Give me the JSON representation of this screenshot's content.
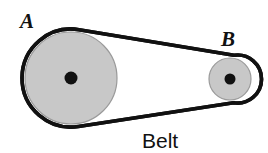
{
  "figure": {
    "type": "mechanical-diagram",
    "background_color": "#ffffff"
  },
  "labels": {
    "pulley_a": "A",
    "pulley_b": "B",
    "belt": "Belt"
  },
  "colors": {
    "pulley_fill": "#c8c8c8",
    "pulley_edge": "#9a9a9a",
    "belt_stroke": "#111111",
    "hub_dot": "#111111",
    "text": "#111111",
    "background": "#ffffff"
  },
  "geometry": {
    "pulley_a": {
      "cx": 71,
      "cy": 78,
      "r": 46,
      "hub_r": 6.5
    },
    "pulley_b": {
      "cx": 230,
      "cy": 79,
      "r": 21,
      "hub_r": 5.5
    },
    "belt": {
      "stroke_width": 3.6,
      "offset_from_pulley": 3,
      "top_tangent": {
        "x1": 71,
        "y1": 29,
        "x2": 230,
        "y2": 55
      },
      "bottom_tangent": {
        "x1": 71,
        "y1": 127,
        "x2": 230,
        "y2": 103
      }
    },
    "label_positions": {
      "pulley_a": {
        "x": 20,
        "y": 28
      },
      "pulley_b": {
        "x": 221,
        "y": 46
      },
      "belt": {
        "x": 142,
        "y": 148
      }
    },
    "label_font_sizes": {
      "pulley_a": 21,
      "pulley_b": 21,
      "belt": 21
    }
  }
}
